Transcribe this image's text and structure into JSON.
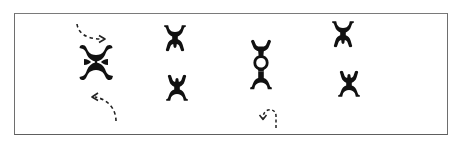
{
  "diagram": {
    "title": "Pictograph figure pairs",
    "colors": {
      "ink": "#111111",
      "frame": "#6e6e6e",
      "background": "#ffffff",
      "arrow": "#222222"
    },
    "groups": [
      {
        "id": "group-1",
        "label": "Interlocked pair with rotation arrows",
        "figures": [
          "inverted",
          "upright"
        ],
        "arrangement": "interlocked",
        "arrows": [
          "dashed-curve-right-top",
          "dashed-curve-left-bottom"
        ]
      },
      {
        "id": "group-2",
        "label": "Separated pair",
        "figures": [
          "inverted",
          "upright"
        ],
        "arrangement": "separate"
      },
      {
        "id": "group-3",
        "label": "Stacked linked pair with curl arrow",
        "figures": [
          "upright-arms-up",
          "inverted"
        ],
        "arrangement": "linked",
        "arrows": [
          "dashed-curl-bottom"
        ]
      },
      {
        "id": "group-4",
        "label": "Separated pair",
        "figures": [
          "inverted",
          "upright"
        ],
        "arrangement": "separate"
      }
    ]
  }
}
